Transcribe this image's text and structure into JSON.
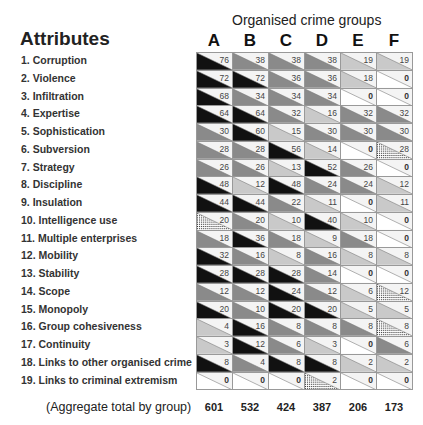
{
  "chart_data": {
    "type": "heatmap",
    "title": "Organised crime groups",
    "row_header": "Attributes",
    "columns": [
      "A",
      "B",
      "C",
      "D",
      "E",
      "F"
    ],
    "rows": [
      {
        "label": "1. Corruption",
        "values": [
          76,
          38,
          38,
          38,
          19,
          19
        ],
        "hatched": []
      },
      {
        "label": "2. Violence",
        "values": [
          72,
          72,
          36,
          36,
          18,
          0
        ],
        "hatched": []
      },
      {
        "label": "3. Infiltration",
        "values": [
          68,
          34,
          34,
          34,
          0,
          0
        ],
        "hatched": []
      },
      {
        "label": "4. Expertise",
        "values": [
          64,
          64,
          32,
          16,
          32,
          32
        ],
        "hatched": []
      },
      {
        "label": "5. Sophistication",
        "values": [
          30,
          60,
          15,
          30,
          30,
          30
        ],
        "hatched": []
      },
      {
        "label": "6. Subversion",
        "values": [
          28,
          28,
          56,
          14,
          0,
          28
        ],
        "hatched": [
          5
        ]
      },
      {
        "label": "7. Strategy",
        "values": [
          26,
          26,
          13,
          52,
          26,
          0
        ],
        "hatched": []
      },
      {
        "label": "8. Discipline",
        "values": [
          48,
          12,
          48,
          24,
          24,
          12
        ],
        "hatched": []
      },
      {
        "label": "9. Insulation",
        "values": [
          44,
          44,
          22,
          11,
          0,
          11
        ],
        "hatched": []
      },
      {
        "label": "10. Intelligence use",
        "values": [
          20,
          20,
          10,
          40,
          10,
          0
        ],
        "hatched": [
          0
        ]
      },
      {
        "label": "11. Multiple enterprises",
        "values": [
          18,
          36,
          18,
          9,
          18,
          0
        ],
        "hatched": []
      },
      {
        "label": "12. Mobility",
        "values": [
          32,
          16,
          8,
          16,
          8,
          8
        ],
        "hatched": []
      },
      {
        "label": "13. Stability",
        "values": [
          28,
          28,
          28,
          14,
          0,
          0
        ],
        "hatched": []
      },
      {
        "label": "14. Scope",
        "values": [
          12,
          12,
          24,
          12,
          6,
          12
        ],
        "hatched": [
          5
        ]
      },
      {
        "label": "15. Monopoly",
        "values": [
          20,
          10,
          20,
          20,
          5,
          5
        ],
        "hatched": []
      },
      {
        "label": "16. Group cohesiveness",
        "values": [
          4,
          16,
          8,
          8,
          8,
          8
        ],
        "hatched": [
          5
        ]
      },
      {
        "label": "17. Continuity",
        "values": [
          3,
          12,
          6,
          3,
          0,
          6
        ],
        "hatched": []
      },
      {
        "label": "18. Links to other organised crime",
        "values": [
          8,
          4,
          8,
          8,
          2,
          2
        ],
        "hatched": []
      },
      {
        "label": "19. Links to criminal extremism",
        "values": [
          0,
          0,
          0,
          2,
          0,
          0
        ],
        "hatched": [
          3
        ]
      }
    ],
    "totals_label": "(Aggregate total by group)",
    "totals": [
      601,
      532,
      424,
      387,
      206,
      173
    ],
    "shade_scale": {
      "max": "#111111",
      "half": "#8a8a8a",
      "quarter": "#c9c9c9",
      "zero": "#ffffff"
    }
  }
}
